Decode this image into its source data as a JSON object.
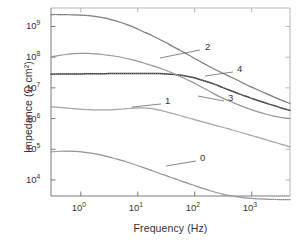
{
  "chart_data": {
    "type": "line",
    "title": "",
    "xlabel": "Frequency (Hz)",
    "ylabel": "Impedance (Ω cm²)",
    "xscale": "log",
    "yscale": "log",
    "xlim": [
      0.3,
      4700
    ],
    "ylim": [
      3000,
      4000000000
    ],
    "xticks": [
      1,
      10,
      100,
      1000
    ],
    "xtick_labels": [
      "10",
      "10",
      "10",
      "10"
    ],
    "xtick_exponents": [
      "0",
      "1",
      "2",
      "3"
    ],
    "yticks": [
      10000,
      100000,
      1000000,
      10000000,
      100000000,
      1000000000
    ],
    "ytick_labels": [
      "10",
      "10",
      "10",
      "10",
      "10",
      "10"
    ],
    "ytick_exponents": [
      "4",
      "5",
      "6",
      "7",
      "8",
      "9"
    ],
    "grid": false,
    "legend": "inline-annotations",
    "marker_style": "small open circles / dense points",
    "series": [
      {
        "name": "2",
        "label": "2",
        "color": "#6e6e6e",
        "points": [
          [
            0.3,
            2450000000.0
          ],
          [
            0.4,
            2450000000.0
          ],
          [
            0.55,
            2420000000.0
          ],
          [
            0.75,
            2400000000.0
          ],
          [
            1.0,
            2350000000.0
          ],
          [
            1.4,
            2250000000.0
          ],
          [
            1.9,
            2100000000.0
          ],
          [
            2.6,
            1900000000.0
          ],
          [
            3.5,
            1650000000.0
          ],
          [
            4.8,
            1400000000.0
          ],
          [
            6.5,
            1150000000.0
          ],
          [
            9.0,
            900000000.0
          ],
          [
            12.0,
            700000000.0
          ],
          [
            17.0,
            530000000.0
          ],
          [
            23.0,
            400000000.0
          ],
          [
            31.0,
            300000000.0
          ],
          [
            42.0,
            220000000.0
          ],
          [
            58.0,
            160000000.0
          ],
          [
            80.0,
            115000000.0
          ],
          [
            110,
            82000000.0
          ],
          [
            150,
            60000000.0
          ],
          [
            200,
            45000000.0
          ],
          [
            280,
            33000000.0
          ],
          [
            380,
            25000000.0
          ],
          [
            520,
            19000000.0
          ],
          [
            700,
            14500000.0
          ],
          [
            950,
            11000000.0
          ],
          [
            1300,
            8500000.0
          ],
          [
            1800,
            6500000.0
          ],
          [
            2500,
            5000000.0
          ],
          [
            3400,
            3900000.0
          ],
          [
            4700,
            3100000.0
          ]
        ]
      },
      {
        "name": "4",
        "label": "4",
        "color": "#3a3a3a",
        "points": [
          [
            0.3,
            28000000.0
          ],
          [
            0.5,
            28200000.0
          ],
          [
            0.8,
            28400000.0
          ],
          [
            1.2,
            28600000.0
          ],
          [
            1.8,
            28800000.0
          ],
          [
            2.6,
            29000000.0
          ],
          [
            3.8,
            29200000.0
          ],
          [
            5.5,
            29400000.0
          ],
          [
            8.0,
            29500000.0
          ],
          [
            11.0,
            29600000.0
          ],
          [
            16.0,
            29500000.0
          ],
          [
            23.0,
            29200000.0
          ],
          [
            32.0,
            28500000.0
          ],
          [
            45.0,
            27200000.0
          ],
          [
            62.0,
            25200000.0
          ],
          [
            85.0,
            22500000.0
          ],
          [
            115,
            19500000.0
          ],
          [
            160,
            16200000.0
          ],
          [
            220,
            13200000.0
          ],
          [
            300,
            10500000.0
          ],
          [
            410,
            8400000.0
          ],
          [
            560,
            6700000.0
          ],
          [
            760,
            5400000.0
          ],
          [
            1050,
            4400000.0
          ],
          [
            1450,
            3600000.0
          ],
          [
            2000,
            2950000.0
          ],
          [
            2800,
            2450000.0
          ],
          [
            3800,
            2050000.0
          ],
          [
            4700,
            1850000.0
          ]
        ]
      },
      {
        "name": "3",
        "label": "3",
        "color": "#8a8a8a",
        "points": [
          [
            0.3,
            102000000.0
          ],
          [
            0.4,
            112000000.0
          ],
          [
            0.55,
            122000000.0
          ],
          [
            0.75,
            130000000.0
          ],
          [
            1.0,
            133000000.0
          ],
          [
            1.35,
            132000000.0
          ],
          [
            1.8,
            128000000.0
          ],
          [
            2.4,
            122000000.0
          ],
          [
            3.2,
            114000000.0
          ],
          [
            4.3,
            105000000.0
          ],
          [
            5.8,
            94000000.0
          ],
          [
            7.8,
            83000000.0
          ],
          [
            10.5,
            72000000.0
          ],
          [
            14.0,
            61000000.0
          ],
          [
            19.0,
            51000000.0
          ],
          [
            26.0,
            42000000.0
          ],
          [
            35.0,
            34000000.0
          ],
          [
            47.0,
            27000000.0
          ],
          [
            64.0,
            21000000.0
          ],
          [
            87.0,
            16000000.0
          ],
          [
            118,
            12000000.0
          ],
          [
            160,
            8800000.0
          ],
          [
            215,
            6500000.0
          ],
          [
            290,
            4900000.0
          ],
          [
            390,
            3800000.0
          ],
          [
            530,
            3000000.0
          ],
          [
            720,
            2400000.0
          ],
          [
            980,
            1950000.0
          ],
          [
            1330,
            1620000.0
          ],
          [
            1800,
            1380000.0
          ],
          [
            2450,
            1200000.0
          ],
          [
            3300,
            1080000.0
          ],
          [
            4700,
            1000000.0
          ]
        ]
      },
      {
        "name": "1",
        "label": "1",
        "color": "#9a9a9a",
        "points": [
          [
            0.3,
            2420000.0
          ],
          [
            0.42,
            2300000.0
          ],
          [
            0.58,
            2180000.0
          ],
          [
            0.8,
            2080000.0
          ],
          [
            1.1,
            2000000.0
          ],
          [
            1.5,
            1950000.0
          ],
          [
            2.0,
            1920000.0
          ],
          [
            2.7,
            1920000.0
          ],
          [
            3.6,
            1950000.0
          ],
          [
            4.8,
            2020000.0
          ],
          [
            6.4,
            2100000.0
          ],
          [
            8.5,
            2180000.0
          ],
          [
            11.0,
            2220000.0
          ],
          [
            14.0,
            2200000.0
          ],
          [
            18.0,
            2100000.0
          ],
          [
            23.0,
            1920000.0
          ],
          [
            30.0,
            1700000.0
          ],
          [
            40.0,
            1480000.0
          ],
          [
            53.0,
            1280000.0
          ],
          [
            70.0,
            1100000.0
          ],
          [
            95.0,
            940000.0
          ],
          [
            128,
            810000.0
          ],
          [
            172,
            700000.0
          ],
          [
            232,
            600000.0
          ],
          [
            312,
            520000.0
          ],
          [
            420,
            445000.0
          ],
          [
            565,
            380000.0
          ],
          [
            760,
            325000.0
          ],
          [
            1020,
            275000.0
          ],
          [
            1380,
            235000.0
          ],
          [
            1850,
            200000.0
          ],
          [
            2500,
            170000.0
          ],
          [
            3350,
            145000.0
          ],
          [
            4700,
            120000.0
          ]
        ]
      },
      {
        "name": "0",
        "label": "0",
        "color": "#888888",
        "points": [
          [
            0.3,
            82000.0
          ],
          [
            0.42,
            86000.0
          ],
          [
            0.58,
            87000.0
          ],
          [
            0.8,
            85000.0
          ],
          [
            1.1,
            81000.0
          ],
          [
            1.5,
            75000.0
          ],
          [
            2.0,
            68000.0
          ],
          [
            2.7,
            60000.0
          ],
          [
            3.6,
            52000.0
          ],
          [
            4.8,
            45000.0
          ],
          [
            6.4,
            38500.0
          ],
          [
            8.5,
            32500.0
          ],
          [
            11.0,
            27500.0
          ],
          [
            14.5,
            23000.0
          ],
          [
            19.0,
            19200.0
          ],
          [
            25.0,
            16000.0
          ],
          [
            33.0,
            13300.0
          ],
          [
            44.0,
            11100.0
          ],
          [
            58.0,
            9200.0
          ],
          [
            77.0,
            7700.0
          ],
          [
            102,
            6400.0
          ],
          [
            135,
            5400.0
          ],
          [
            180,
            4550.0
          ],
          [
            240,
            3900.0
          ],
          [
            320,
            3400.0
          ],
          [
            425,
            3050.0
          ],
          [
            565,
            2800.0
          ],
          [
            750,
            2620.0
          ],
          [
            1000,
            2500.0
          ],
          [
            1330,
            2420.0
          ],
          [
            1780,
            2360.0
          ],
          [
            2400,
            2320.0
          ],
          [
            3200,
            2300.0
          ],
          [
            4700,
            2280.0
          ]
        ]
      }
    ],
    "annotations": [
      {
        "label": "2",
        "text_x": 205,
        "text_y": 47,
        "leader_from_x": 200,
        "leader_from_y": 50,
        "leader_to_x": 160,
        "leader_to_y": 58
      },
      {
        "label": "4",
        "text_x": 237,
        "text_y": 69,
        "leader_from_x": 233,
        "leader_from_y": 72,
        "leader_to_x": 205,
        "leader_to_y": 76
      },
      {
        "label": "3",
        "text_x": 228,
        "text_y": 98,
        "leader_from_x": 224,
        "leader_from_y": 101,
        "leader_to_x": 198,
        "leader_to_y": 96
      },
      {
        "label": "1",
        "text_x": 165,
        "text_y": 101,
        "leader_from_x": 161,
        "leader_from_y": 104,
        "leader_to_x": 132,
        "leader_to_y": 107
      },
      {
        "label": "0",
        "text_x": 200,
        "text_y": 158,
        "leader_from_x": 196,
        "leader_from_y": 161,
        "leader_to_x": 166,
        "leader_to_y": 166
      }
    ]
  }
}
